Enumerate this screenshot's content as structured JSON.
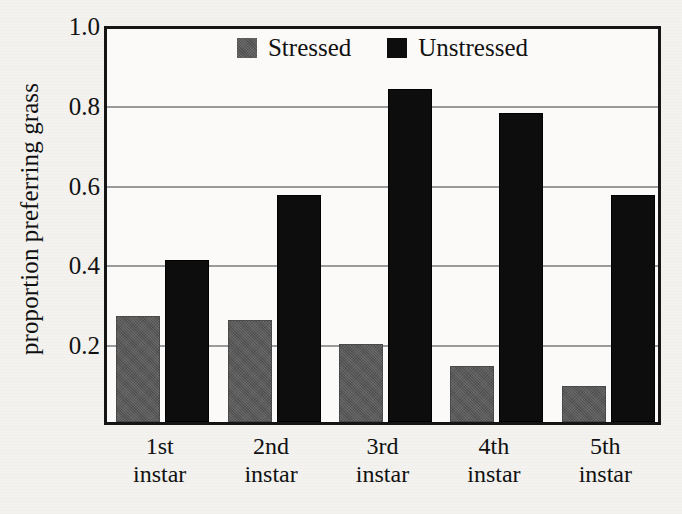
{
  "figure": {
    "y_axis_title": "proportion preferring grass",
    "y_ticks": [
      "1.0",
      "0.8",
      "0.6",
      "0.4",
      "0.2"
    ],
    "legend": [
      {
        "label": "Stressed",
        "swatch": "gray-swatch-icon",
        "color": "#585858"
      },
      {
        "label": "Unstressed",
        "swatch": "black-swatch-icon",
        "color": "#0d0d0d"
      }
    ],
    "x_labels": [
      {
        "line1": "1st",
        "line2": "instar"
      },
      {
        "line1": "2nd",
        "line2": "instar"
      },
      {
        "line1": "3rd",
        "line2": "instar"
      },
      {
        "line1": "4th",
        "line2": "instar"
      },
      {
        "line1": "5th",
        "line2": "instar"
      }
    ]
  },
  "chart_data": {
    "type": "bar",
    "title": "",
    "xlabel": "",
    "ylabel": "proportion preferring grass",
    "categories": [
      "1st instar",
      "2nd instar",
      "3rd instar",
      "4th instar",
      "5th instar"
    ],
    "series": [
      {
        "name": "Stressed",
        "color": "#585858",
        "values": [
          0.265,
          0.255,
          0.195,
          0.14,
          0.09
        ]
      },
      {
        "name": "Unstressed",
        "color": "#0d0d0d",
        "values": [
          0.405,
          0.57,
          0.835,
          0.775,
          0.57
        ]
      }
    ],
    "ylim": [
      0,
      1.0
    ],
    "yticks": [
      0.2,
      0.4,
      0.6,
      0.8,
      1.0
    ],
    "grid": "horizontal",
    "legend_position": "top-center"
  }
}
